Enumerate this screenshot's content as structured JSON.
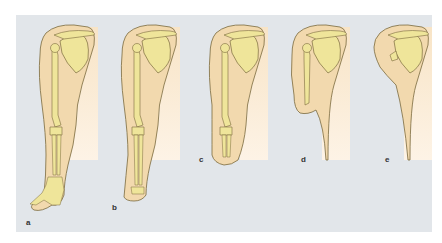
{
  "figure": {
    "colors": {
      "background": "#e2e6ea",
      "skin": "#f2d9ae",
      "skin_light": "#fbecd6",
      "bone": "#efe59a",
      "outline": "#7a6a3e"
    },
    "panels": [
      {
        "label": "a",
        "level": "full arm with hand"
      },
      {
        "label": "b",
        "level": "wrist disarticulation"
      },
      {
        "label": "c",
        "level": "forearm stump"
      },
      {
        "label": "d",
        "level": "upper arm stump"
      },
      {
        "label": "e",
        "level": "shoulder disarticulation"
      }
    ]
  }
}
